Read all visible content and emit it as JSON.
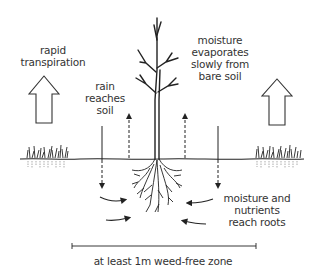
{
  "diagram": {
    "labels": {
      "transpiration": [
        "rapid",
        "transpiration"
      ],
      "rain": [
        "rain",
        "reaches",
        "soil"
      ],
      "evaporation": [
        "moisture",
        "evaporates",
        "slowly from",
        "bare soil"
      ],
      "nutrients": [
        "moisture and",
        "nutrients",
        "reach roots"
      ],
      "zone": "at least 1m weed-free zone"
    },
    "colors": {
      "ink": "#222222",
      "text": "#333333",
      "background": "#ffffff"
    },
    "elements": [
      "tree",
      "roots",
      "soil-line",
      "grass-left",
      "grass-right",
      "hollow-up-arrow-left",
      "hollow-up-arrow-right",
      "rain-arrow-left",
      "rain-arrow-right",
      "evaporation-arrow-left",
      "evaporation-arrow-right",
      "root-flow-arrows",
      "zone-dimension-line"
    ]
  }
}
